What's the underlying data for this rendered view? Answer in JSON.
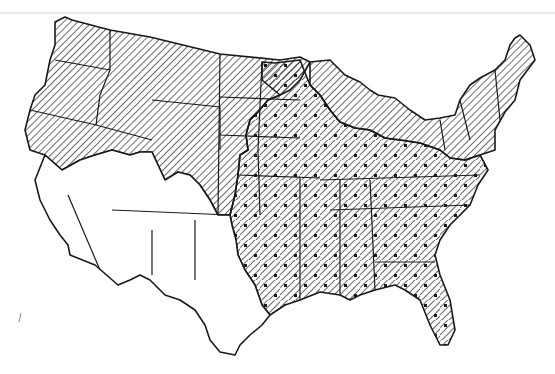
{
  "map": {
    "subject": "Contiguous United States by state",
    "style": "black and white line map",
    "zones": [
      {
        "id": "hatched",
        "pattern": "diagonal-hatch",
        "region": "northern and western states (WA, OR, ID, MT, WY, northern CA/NV/UT, CO, western Dakotas/Nebraska/Kansas, Great Lakes upper, New England, NY, PA, NJ)"
      },
      {
        "id": "hatched-dotted",
        "pattern": "diagonal-hatch-with-dots",
        "region": "central and southeastern states (eastern Dakotas, MN, IA, MO, eastern NE/KS, OK east, AR, LA, IL, IN, OH, KY, TN, MS, AL, GA, FL, SC, NC, VA, WV, MD, eastern TX)"
      },
      {
        "id": "blank",
        "pattern": "none",
        "region": "southwestern states (southern CA, southern NV, AZ, NM, southern UT/CO, west/central TX)"
      }
    ],
    "colors": {
      "ink": "#1a1a1a",
      "paper": "#ffffff"
    },
    "stray_mark": {
      "x": 20,
      "y": 318
    }
  }
}
